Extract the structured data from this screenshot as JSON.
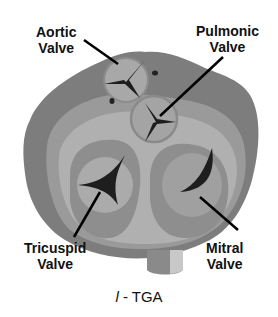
{
  "labels": {
    "aortic": [
      "Aortic",
      "Valve"
    ],
    "pulmonic": [
      "Pulmonic",
      "Valve"
    ],
    "tricuspid": [
      "Tricuspid",
      "Valve"
    ],
    "mitral": [
      "Mitral",
      "Valve"
    ]
  },
  "caption": {
    "prefix": "l",
    "suffix": " - TGA"
  },
  "colors": {
    "outer_tissue": "#7d7d7d",
    "mid_tissue": "#9a9a9a",
    "light_tissue": "#b0b0b0",
    "leaflet": "#a8a8a8",
    "orifice": "#1e1e1e",
    "text": "#111111"
  }
}
